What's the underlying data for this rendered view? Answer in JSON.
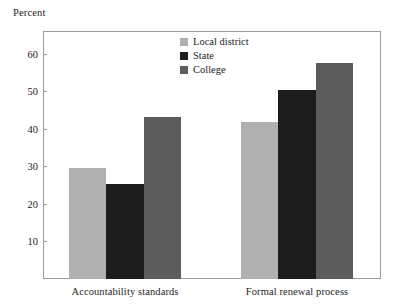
{
  "chart_data": {
    "type": "bar",
    "title": "",
    "subtitle": "",
    "xlabel": "",
    "ylabel": "Percent",
    "ylim": [
      0,
      66
    ],
    "yticks": [
      10,
      20,
      30,
      40,
      50,
      60
    ],
    "ytick_labels": [
      "10",
      "20",
      "30",
      "40",
      "50",
      "60"
    ],
    "grid": false,
    "legend_position": "top-center",
    "categories": [
      "Accountability standards",
      "Formal renewal process"
    ],
    "series": [
      {
        "name": "Local district",
        "color": "#b0b0b0",
        "values": [
          29.5,
          41.8
        ]
      },
      {
        "name": "State",
        "color": "#1d1d1d",
        "values": [
          25.2,
          50.3
        ]
      },
      {
        "name": "College",
        "color": "#5c5c5c",
        "values": [
          43.0,
          57.5
        ]
      }
    ],
    "annotations": []
  },
  "axis": {
    "y_title": "Percent"
  },
  "legend": {
    "items": [
      {
        "label": "Local district",
        "swatch": "local-district-swatch"
      },
      {
        "label": "State",
        "swatch": "state-swatch"
      },
      {
        "label": "College",
        "swatch": "college-swatch"
      }
    ]
  }
}
